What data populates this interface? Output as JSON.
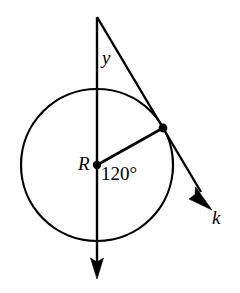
{
  "figure": {
    "background_color": "#ffffff",
    "stroke_color": "#000000",
    "labels": {
      "center_label": "R",
      "angle_label_y": "y",
      "line_label_k": "k",
      "central_angle": "120°"
    },
    "geometry": {
      "circle": {
        "cx": 97,
        "cy": 165,
        "r": 76
      },
      "center_point": {
        "x": 97,
        "y": 165
      },
      "tangent_point": {
        "x": 163,
        "y": 128
      },
      "apex_point": {
        "x": 97,
        "y": 17
      },
      "vertical_line": {
        "x1": 97,
        "y1": 17,
        "x2": 97,
        "y2": 276
      },
      "vertical_arrow_tip": {
        "x": 97,
        "y": 278
      },
      "line_k": {
        "x1": 97,
        "y1": 17,
        "x2": 209,
        "y2": 206
      },
      "line_k_arrow_tip": {
        "x": 211,
        "y": 209
      },
      "radius_segment": {
        "x1": 97,
        "y1": 165,
        "x2": 163,
        "y2": 128
      },
      "central_angle_degrees": 120
    }
  }
}
